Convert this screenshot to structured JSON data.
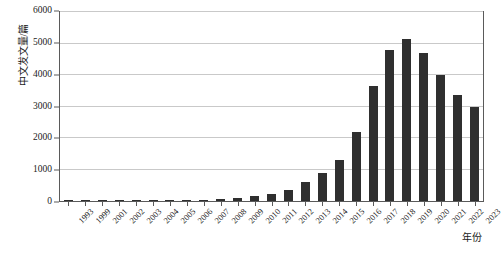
{
  "chart_data": {
    "type": "bar",
    "title": "",
    "xlabel": "年份",
    "ylabel": "中文发文量/篇",
    "ylim": [
      0,
      6000
    ],
    "ytick_values": [
      0,
      1000,
      2000,
      3000,
      4000,
      5000,
      6000
    ],
    "ytick_labels": [
      "0",
      "1000",
      "2000",
      "3000",
      "4000",
      "5000",
      "6000"
    ],
    "grid": true,
    "legend": "none",
    "bar_color": "#2f2f2f",
    "categories": [
      "1993",
      "1999",
      "2001",
      "2002",
      "2003",
      "2004",
      "2005",
      "2006",
      "2007",
      "2008",
      "2009",
      "2010",
      "2011",
      "2012",
      "2013",
      "2014",
      "2015",
      "2016",
      "2017",
      "2018",
      "2019",
      "2020",
      "2021",
      "2022",
      "2023"
    ],
    "values": [
      20,
      25,
      30,
      35,
      30,
      40,
      35,
      45,
      40,
      55,
      90,
      150,
      230,
      350,
      600,
      900,
      1300,
      2200,
      3650,
      4800,
      5150,
      4700,
      4000,
      3350,
      2980
    ]
  }
}
